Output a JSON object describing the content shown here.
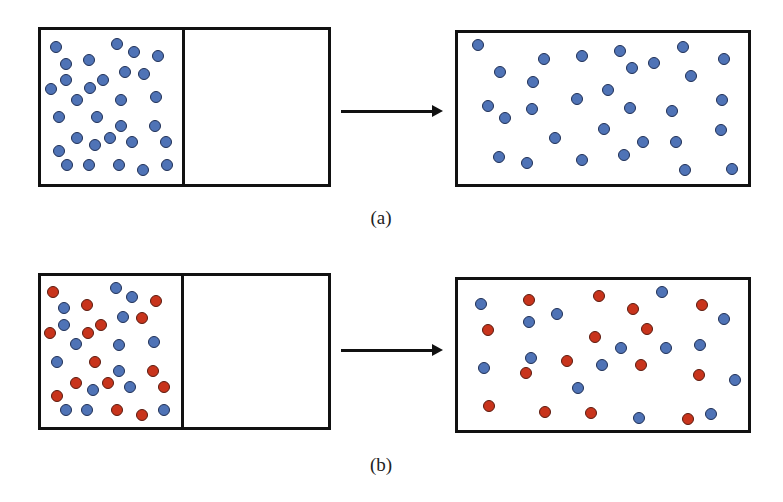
{
  "figure": {
    "colors": {
      "blue": "#4f73b6",
      "red": "#c8341c",
      "outline": "#111111"
    },
    "panels": [
      {
        "id": "a",
        "caption": "(a)",
        "initial": {
          "box": {
            "x": 38,
            "y": 27,
            "w": 293,
            "h": 160
          },
          "divider_x": 182,
          "particles": [
            {
              "x": 56,
              "y": 47,
              "c": "blue"
            },
            {
              "x": 117,
              "y": 44,
              "c": "blue"
            },
            {
              "x": 134,
              "y": 52,
              "c": "blue"
            },
            {
              "x": 158,
              "y": 56,
              "c": "blue"
            },
            {
              "x": 66,
              "y": 64,
              "c": "blue"
            },
            {
              "x": 89,
              "y": 60,
              "c": "blue"
            },
            {
              "x": 125,
              "y": 72,
              "c": "blue"
            },
            {
              "x": 144,
              "y": 74,
              "c": "blue"
            },
            {
              "x": 66,
              "y": 80,
              "c": "blue"
            },
            {
              "x": 51,
              "y": 89,
              "c": "blue"
            },
            {
              "x": 90,
              "y": 88,
              "c": "blue"
            },
            {
              "x": 103,
              "y": 80,
              "c": "blue"
            },
            {
              "x": 77,
              "y": 100,
              "c": "blue"
            },
            {
              "x": 121,
              "y": 100,
              "c": "blue"
            },
            {
              "x": 156,
              "y": 97,
              "c": "blue"
            },
            {
              "x": 59,
              "y": 117,
              "c": "blue"
            },
            {
              "x": 97,
              "y": 117,
              "c": "blue"
            },
            {
              "x": 121,
              "y": 126,
              "c": "blue"
            },
            {
              "x": 155,
              "y": 126,
              "c": "blue"
            },
            {
              "x": 77,
              "y": 138,
              "c": "blue"
            },
            {
              "x": 110,
              "y": 138,
              "c": "blue"
            },
            {
              "x": 95,
              "y": 145,
              "c": "blue"
            },
            {
              "x": 132,
              "y": 142,
              "c": "blue"
            },
            {
              "x": 166,
              "y": 142,
              "c": "blue"
            },
            {
              "x": 59,
              "y": 151,
              "c": "blue"
            },
            {
              "x": 67,
              "y": 165,
              "c": "blue"
            },
            {
              "x": 89,
              "y": 165,
              "c": "blue"
            },
            {
              "x": 119,
              "y": 165,
              "c": "blue"
            },
            {
              "x": 143,
              "y": 170,
              "c": "blue"
            },
            {
              "x": 167,
              "y": 165,
              "c": "blue"
            }
          ]
        },
        "arrow": {
          "x1": 341,
          "x2": 433,
          "y": 111
        },
        "final": {
          "box": {
            "x": 455,
            "y": 30,
            "w": 296,
            "h": 157
          },
          "particles": [
            {
              "x": 478,
              "y": 45,
              "c": "blue"
            },
            {
              "x": 500,
              "y": 72,
              "c": "blue"
            },
            {
              "x": 544,
              "y": 59,
              "c": "blue"
            },
            {
              "x": 582,
              "y": 56,
              "c": "blue"
            },
            {
              "x": 620,
              "y": 51,
              "c": "blue"
            },
            {
              "x": 683,
              "y": 47,
              "c": "blue"
            },
            {
              "x": 724,
              "y": 59,
              "c": "blue"
            },
            {
              "x": 632,
              "y": 68,
              "c": "blue"
            },
            {
              "x": 654,
              "y": 63,
              "c": "blue"
            },
            {
              "x": 691,
              "y": 76,
              "c": "blue"
            },
            {
              "x": 533,
              "y": 82,
              "c": "blue"
            },
            {
              "x": 608,
              "y": 90,
              "c": "blue"
            },
            {
              "x": 488,
              "y": 106,
              "c": "blue"
            },
            {
              "x": 505,
              "y": 118,
              "c": "blue"
            },
            {
              "x": 532,
              "y": 109,
              "c": "blue"
            },
            {
              "x": 577,
              "y": 99,
              "c": "blue"
            },
            {
              "x": 630,
              "y": 108,
              "c": "blue"
            },
            {
              "x": 672,
              "y": 111,
              "c": "blue"
            },
            {
              "x": 722,
              "y": 100,
              "c": "blue"
            },
            {
              "x": 604,
              "y": 129,
              "c": "blue"
            },
            {
              "x": 555,
              "y": 138,
              "c": "blue"
            },
            {
              "x": 643,
              "y": 142,
              "c": "blue"
            },
            {
              "x": 676,
              "y": 142,
              "c": "blue"
            },
            {
              "x": 721,
              "y": 130,
              "c": "blue"
            },
            {
              "x": 499,
              "y": 157,
              "c": "blue"
            },
            {
              "x": 527,
              "y": 163,
              "c": "blue"
            },
            {
              "x": 582,
              "y": 160,
              "c": "blue"
            },
            {
              "x": 624,
              "y": 155,
              "c": "blue"
            },
            {
              "x": 685,
              "y": 170,
              "c": "blue"
            },
            {
              "x": 732,
              "y": 169,
              "c": "blue"
            }
          ]
        },
        "caption_pos": {
          "x": 381,
          "y": 207
        }
      },
      {
        "id": "b",
        "caption": "(b)",
        "initial": {
          "box": {
            "x": 38,
            "y": 273,
            "w": 293,
            "h": 157
          },
          "divider_x": 181,
          "particles": [
            {
              "x": 53,
              "y": 292,
              "c": "red"
            },
            {
              "x": 116,
              "y": 288,
              "c": "blue"
            },
            {
              "x": 132,
              "y": 297,
              "c": "blue"
            },
            {
              "x": 156,
              "y": 301,
              "c": "red"
            },
            {
              "x": 64,
              "y": 308,
              "c": "blue"
            },
            {
              "x": 87,
              "y": 305,
              "c": "red"
            },
            {
              "x": 123,
              "y": 317,
              "c": "blue"
            },
            {
              "x": 142,
              "y": 318,
              "c": "red"
            },
            {
              "x": 64,
              "y": 325,
              "c": "blue"
            },
            {
              "x": 50,
              "y": 333,
              "c": "red"
            },
            {
              "x": 88,
              "y": 333,
              "c": "red"
            },
            {
              "x": 101,
              "y": 325,
              "c": "red"
            },
            {
              "x": 76,
              "y": 344,
              "c": "blue"
            },
            {
              "x": 119,
              "y": 345,
              "c": "blue"
            },
            {
              "x": 154,
              "y": 342,
              "c": "blue"
            },
            {
              "x": 57,
              "y": 362,
              "c": "blue"
            },
            {
              "x": 95,
              "y": 362,
              "c": "red"
            },
            {
              "x": 119,
              "y": 371,
              "c": "blue"
            },
            {
              "x": 153,
              "y": 371,
              "c": "red"
            },
            {
              "x": 76,
              "y": 383,
              "c": "red"
            },
            {
              "x": 108,
              "y": 383,
              "c": "red"
            },
            {
              "x": 93,
              "y": 390,
              "c": "blue"
            },
            {
              "x": 130,
              "y": 387,
              "c": "blue"
            },
            {
              "x": 164,
              "y": 387,
              "c": "red"
            },
            {
              "x": 57,
              "y": 396,
              "c": "red"
            },
            {
              "x": 66,
              "y": 410,
              "c": "blue"
            },
            {
              "x": 87,
              "y": 410,
              "c": "blue"
            },
            {
              "x": 117,
              "y": 410,
              "c": "red"
            },
            {
              "x": 142,
              "y": 415,
              "c": "red"
            },
            {
              "x": 164,
              "y": 410,
              "c": "blue"
            }
          ]
        },
        "arrow": {
          "x1": 341,
          "x2": 433,
          "y": 350
        },
        "final": {
          "box": {
            "x": 455,
            "y": 277,
            "w": 296,
            "h": 156
          },
          "particles": [
            {
              "x": 481,
              "y": 304,
              "c": "blue"
            },
            {
              "x": 529,
              "y": 300,
              "c": "red"
            },
            {
              "x": 599,
              "y": 296,
              "c": "red"
            },
            {
              "x": 662,
              "y": 292,
              "c": "blue"
            },
            {
              "x": 633,
              "y": 309,
              "c": "red"
            },
            {
              "x": 702,
              "y": 305,
              "c": "red"
            },
            {
              "x": 529,
              "y": 322,
              "c": "blue"
            },
            {
              "x": 557,
              "y": 314,
              "c": "blue"
            },
            {
              "x": 488,
              "y": 330,
              "c": "red"
            },
            {
              "x": 647,
              "y": 329,
              "c": "red"
            },
            {
              "x": 724,
              "y": 319,
              "c": "blue"
            },
            {
              "x": 595,
              "y": 337,
              "c": "red"
            },
            {
              "x": 621,
              "y": 348,
              "c": "blue"
            },
            {
              "x": 666,
              "y": 348,
              "c": "blue"
            },
            {
              "x": 700,
              "y": 345,
              "c": "blue"
            },
            {
              "x": 531,
              "y": 358,
              "c": "blue"
            },
            {
              "x": 567,
              "y": 361,
              "c": "red"
            },
            {
              "x": 602,
              "y": 365,
              "c": "blue"
            },
            {
              "x": 641,
              "y": 365,
              "c": "red"
            },
            {
              "x": 484,
              "y": 368,
              "c": "blue"
            },
            {
              "x": 526,
              "y": 373,
              "c": "red"
            },
            {
              "x": 699,
              "y": 375,
              "c": "red"
            },
            {
              "x": 735,
              "y": 380,
              "c": "blue"
            },
            {
              "x": 578,
              "y": 388,
              "c": "blue"
            },
            {
              "x": 489,
              "y": 406,
              "c": "red"
            },
            {
              "x": 545,
              "y": 412,
              "c": "red"
            },
            {
              "x": 591,
              "y": 413,
              "c": "red"
            },
            {
              "x": 639,
              "y": 418,
              "c": "blue"
            },
            {
              "x": 688,
              "y": 419,
              "c": "red"
            },
            {
              "x": 711,
              "y": 414,
              "c": "blue"
            }
          ]
        },
        "caption_pos": {
          "x": 381,
          "y": 454
        }
      }
    ]
  }
}
